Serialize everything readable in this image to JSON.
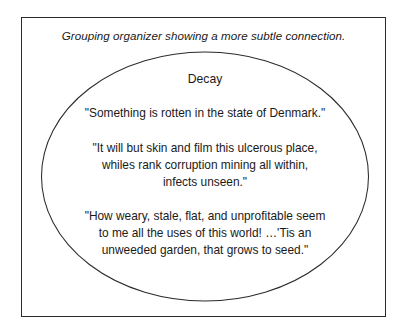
{
  "figure": {
    "caption": "Grouping organizer showing a more subtle connection.",
    "frame_color": "#2b2b2b",
    "background_color": "#ffffff",
    "text_color": "#1a1a1a"
  },
  "organizer": {
    "shape": "ellipse",
    "group_title": "Decay",
    "quotes": [
      {
        "id": "quote-1",
        "lines": [
          "\"Something is rotten in the state of Denmark.\""
        ]
      },
      {
        "id": "quote-2",
        "lines": [
          "\"It will but skin and film this ulcerous place,",
          "whiles rank corruption mining all within,",
          "infects unseen.\""
        ]
      },
      {
        "id": "quote-3",
        "lines": [
          "\"How weary, stale, flat, and unprofitable seem",
          "to me all the uses of this world! …'Tis an",
          "unweeded garden, that grows to seed.\""
        ]
      }
    ]
  }
}
